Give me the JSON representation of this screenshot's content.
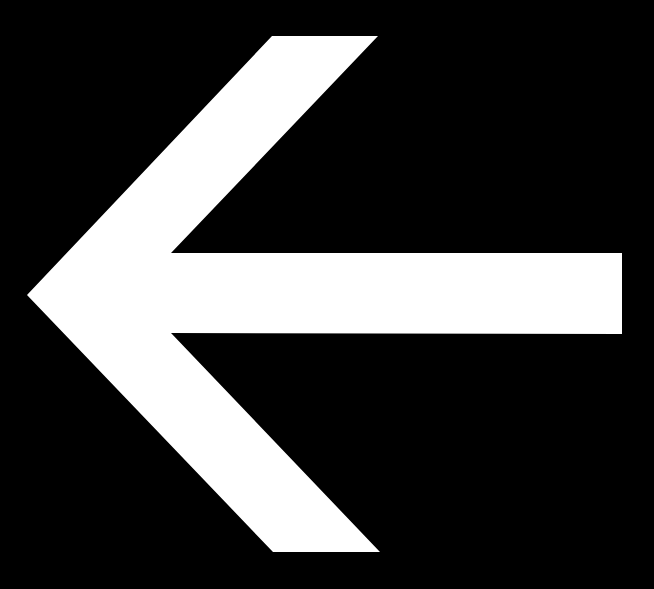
{
  "canvas": {
    "width": 654,
    "height": 589,
    "background_color": "#000000",
    "foreground_color": "#FFFFFF",
    "alt_text": "Left-pointing arrow"
  },
  "icon": {
    "name": "arrow-left-icon",
    "semantic": "back / previous / left navigation",
    "direction": "left",
    "fill_color": "#FFFFFF",
    "stroke_color": "none",
    "polygon_points": "27,295 272,36 378,36 171,253 622,253 622,334 171,333 380,552 273,552",
    "vertices": [
      {
        "label": "tip",
        "x": 27,
        "y": 295
      },
      {
        "label": "head-upper-outer-top-left",
        "x": 272,
        "y": 36
      },
      {
        "label": "head-upper-outer-top-right",
        "x": 378,
        "y": 36
      },
      {
        "label": "head-upper-inner-notch",
        "x": 171,
        "y": 253
      },
      {
        "label": "shaft-top-right",
        "x": 622,
        "y": 253
      },
      {
        "label": "shaft-bottom-right",
        "x": 622,
        "y": 334
      },
      {
        "label": "head-lower-inner-notch",
        "x": 171,
        "y": 333
      },
      {
        "label": "head-lower-outer-bottom-right",
        "x": 380,
        "y": 552
      },
      {
        "label": "head-lower-outer-bottom-left",
        "x": 273,
        "y": 552
      }
    ],
    "shaft": {
      "left_x": 171,
      "right_x": 622,
      "top_y": 253,
      "bottom_y": 334,
      "thickness_px": 81
    },
    "head": {
      "tip_x": 27,
      "tip_y": 295,
      "top_y": 36,
      "bottom_y": 552,
      "span_height_px": 516,
      "back_edge_x": 380
    }
  }
}
